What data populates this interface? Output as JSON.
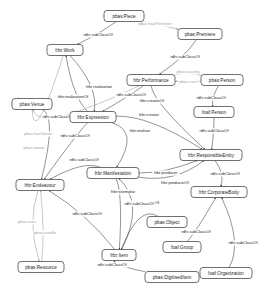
{
  "diagram": {
    "type": "node-link-graph",
    "width": 258,
    "height": 298,
    "background": "#ffffff",
    "node_fill": "#ffffff",
    "node_stroke": "#4a4a4a",
    "edge_color": "#3a3a3a",
    "edge_color_faint": "#9a9a9a",
    "nodes": [
      {
        "id": "piece",
        "label": "pbas:Piece",
        "x": 124,
        "y": 16,
        "w": 40,
        "h": 11
      },
      {
        "id": "premiere",
        "label": "pbas:Premiere",
        "x": 200,
        "y": 34,
        "w": 44,
        "h": 11
      },
      {
        "id": "work",
        "label": "frbr:Work",
        "x": 65,
        "y": 50,
        "w": 36,
        "h": 11
      },
      {
        "id": "performance",
        "label": "frbr:Performance",
        "x": 151,
        "y": 80,
        "w": 48,
        "h": 11
      },
      {
        "id": "person_pbas",
        "label": "pbas:Person",
        "x": 222,
        "y": 80,
        "w": 42,
        "h": 11
      },
      {
        "id": "expression",
        "label": "frbr:Expression",
        "x": 93,
        "y": 117,
        "w": 46,
        "h": 11
      },
      {
        "id": "venue",
        "label": "pbas:Venue",
        "x": 32,
        "y": 104,
        "w": 40,
        "h": 11
      },
      {
        "id": "person_foaf",
        "label": "foaf:Person",
        "x": 214,
        "y": 112,
        "w": 40,
        "h": 11
      },
      {
        "id": "responsibleentity",
        "label": "frbr:ResponsibleEntity",
        "x": 211,
        "y": 155,
        "w": 62,
        "h": 11
      },
      {
        "id": "manifestation",
        "label": "frbr:Manifestation",
        "x": 113,
        "y": 173,
        "w": 52,
        "h": 11
      },
      {
        "id": "endeavour",
        "label": "frbr:Endeavour",
        "x": 40,
        "y": 185,
        "w": 48,
        "h": 11
      },
      {
        "id": "corporatebody",
        "label": "frbr:CorporateBody",
        "x": 219,
        "y": 192,
        "w": 56,
        "h": 11
      },
      {
        "id": "object",
        "label": "pbas:Object",
        "x": 167,
        "y": 222,
        "w": 40,
        "h": 11
      },
      {
        "id": "item",
        "label": "frbr:Item",
        "x": 119,
        "y": 255,
        "w": 34,
        "h": 11
      },
      {
        "id": "group",
        "label": "foaf:Group",
        "x": 182,
        "y": 247,
        "w": 38,
        "h": 11
      },
      {
        "id": "organization",
        "label": "foaf:Organization",
        "x": 226,
        "y": 273,
        "w": 52,
        "h": 11
      },
      {
        "id": "digitiseditem",
        "label": "pbas:DigitisedItem",
        "x": 172,
        "y": 277,
        "w": 54,
        "h": 11
      },
      {
        "id": "resource",
        "label": "pbas:Resource",
        "x": 41,
        "y": 267,
        "w": 46,
        "h": 11
      }
    ],
    "edges": [
      {
        "from": "piece",
        "to": "work",
        "label": "rdfs:subClassOf",
        "lx": 98,
        "ly": 35,
        "faint": false
      },
      {
        "from": "piece",
        "to": "premiere",
        "label": "pbas:hasPremiere",
        "lx": 155,
        "ly": 24,
        "faint": true
      },
      {
        "from": "premiere",
        "to": "performance",
        "label": "rdfs:subClassOf",
        "lx": 185,
        "ly": 57,
        "faint": false
      },
      {
        "from": "performance",
        "to": "person_pbas",
        "label": "pbas:casting",
        "lx": 188,
        "ly": 72,
        "faint": true
      },
      {
        "from": "person_pbas",
        "to": "performance",
        "label": "pbas:cast",
        "lx": 188,
        "ly": 82,
        "faint": true
      },
      {
        "from": "performance",
        "to": "expression",
        "label": "rdfs:subClassOf",
        "lx": 131,
        "ly": 95,
        "faint": false
      },
      {
        "from": "person_pbas",
        "to": "person_foaf",
        "label": "rdfs:subClassOf",
        "lx": 211,
        "ly": 98,
        "faint": false
      },
      {
        "from": "person_foaf",
        "to": "responsibleentity",
        "label": "rdfs:subClassOf",
        "lx": 214,
        "ly": 131,
        "faint": false
      },
      {
        "from": "work",
        "to": "expression",
        "label": "frbr:realization",
        "lx": 99,
        "ly": 87,
        "faint": false
      },
      {
        "from": "expression",
        "to": "work",
        "label": "frbr:realizationOf",
        "lx": 73,
        "ly": 97,
        "faint": false
      },
      {
        "from": "work",
        "to": "venue",
        "label": "pbas:venue",
        "lx": 34,
        "ly": 148,
        "faint": true
      },
      {
        "from": "venue",
        "to": "endeavour",
        "label": "rdfs:subClassOf",
        "lx": 57,
        "ly": 117,
        "faint": false
      },
      {
        "from": "performance",
        "to": "venue",
        "label": "pbas:hasVenue",
        "lx": 38,
        "ly": 134,
        "faint": true
      },
      {
        "from": "expression",
        "to": "responsibleentity",
        "label": "frbr:creator",
        "lx": 149,
        "ly": 115,
        "faint": false
      },
      {
        "from": "performance",
        "to": "responsibleentity",
        "label": "frbr:creatorOf",
        "lx": 152,
        "ly": 101,
        "faint": false
      },
      {
        "from": "expression",
        "to": "endeavour",
        "label": "rdfs:subClassOf",
        "lx": 75,
        "ly": 136,
        "faint": false
      },
      {
        "from": "expression",
        "to": "manifestation",
        "label": "frbr:realiser",
        "lx": 140,
        "ly": 131,
        "faint": false
      },
      {
        "from": "manifestation",
        "to": "endeavour",
        "label": "rdfs:subClassOf",
        "lx": 84,
        "ly": 160,
        "faint": false
      },
      {
        "from": "manifestation",
        "to": "responsibleentity",
        "label": "frbr:producer",
        "lx": 166,
        "ly": 173,
        "faint": false
      },
      {
        "from": "manifestation",
        "to": "responsibleentity",
        "label": "frbr:producerOf",
        "lx": 175,
        "ly": 183,
        "faint": false
      },
      {
        "from": "manifestation",
        "to": "item",
        "label": "frbr:exemplar",
        "lx": 123,
        "ly": 192,
        "faint": false
      },
      {
        "from": "item",
        "to": "manifestation",
        "label": "frbr:exemplarOf",
        "lx": 145,
        "ly": 203,
        "faint": false
      },
      {
        "from": "item",
        "to": "endeavour",
        "label": "rdfs:subClassOf",
        "lx": 87,
        "ly": 214,
        "faint": false
      },
      {
        "from": "object",
        "to": "item",
        "label": "rdfs:subClassOf",
        "lx": 139,
        "ly": 204,
        "faint": false
      },
      {
        "from": "digitiseditem",
        "to": "item",
        "label": "rdfs:subClassOf",
        "lx": 112,
        "ly": 265,
        "faint": false
      },
      {
        "from": "responsibleentity",
        "to": "corporatebody",
        "label": "rdfs:subClassOf",
        "lx": 225,
        "ly": 174,
        "faint": false
      },
      {
        "from": "group",
        "to": "corporatebody",
        "label": "rdfs:subClassOf",
        "lx": 196,
        "ly": 232,
        "faint": false
      },
      {
        "from": "organization",
        "to": "corporatebody",
        "label": "rdfs:subClassOf",
        "lx": 243,
        "ly": 243,
        "faint": false
      },
      {
        "from": "endeavour",
        "to": "resource",
        "label": "pbas:uses",
        "lx": 27,
        "ly": 222,
        "faint": true
      },
      {
        "from": "resource",
        "to": "endeavour",
        "label": "pbas:usedIn",
        "lx": 45,
        "ly": 233,
        "faint": true
      }
    ]
  }
}
